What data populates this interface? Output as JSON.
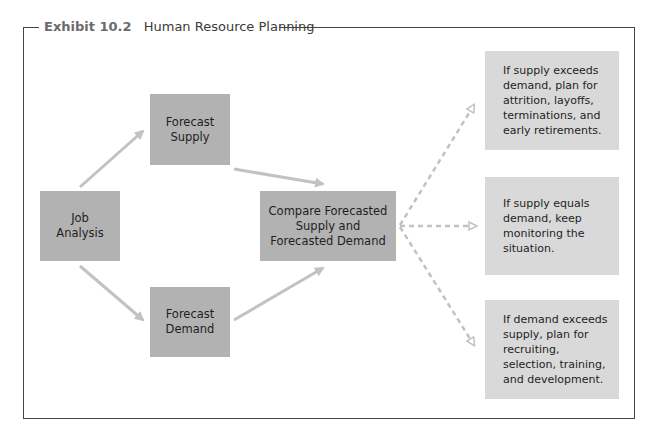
{
  "exhibit": {
    "number": "Exhibit 10.2",
    "title": "Human Resource Planning"
  },
  "nodes": {
    "job_analysis": "Job Analysis",
    "forecast_supply": "Forecast Supply",
    "forecast_demand": "Forecast Demand",
    "compare": "Compare Forecasted Supply and Forecasted Demand"
  },
  "outcomes": [
    {
      "condition": "supply exceeds demand",
      "text": "If supply exceeds demand, plan for attrition, layoffs, terminations, and early retirements."
    },
    {
      "condition": "supply equals demand",
      "text": "If supply equals demand, keep monitoring the situation."
    },
    {
      "condition": "demand exceeds supply",
      "text": "If demand exceeds supply, plan for recruiting, selection, training, and development."
    }
  ],
  "colors": {
    "process_box": "#b2b2b2",
    "outcome_box": "#d9d9d9",
    "arrow": "#c2c2c2",
    "frame": "#444444",
    "exhibit_number": "#6b6b6b"
  }
}
